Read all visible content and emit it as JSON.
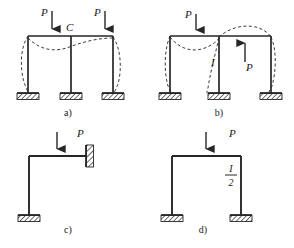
{
  "figure": {
    "background_color": "#ffffff",
    "line_color": "#262626",
    "dash_color": "#3a3a3a",
    "label_color": "#1a1a1a"
  },
  "panels": [
    {
      "id": "a",
      "caption": "a)",
      "description": "Two-bay portal frame with three fixed column bases, two downward loads P on the top beam, dashed buckled shape",
      "loads": [
        {
          "name": "load-p-left",
          "label": "P",
          "direction": "down"
        },
        {
          "name": "load-p-right",
          "label": "P",
          "direction": "down"
        }
      ],
      "node_labels": [
        {
          "name": "node-c",
          "label": "C"
        }
      ],
      "supports": 3,
      "support_type": "fixed"
    },
    {
      "id": "b",
      "caption": "b)",
      "description": "Two-bay portal frame with three fixed column bases, one downward load P on left bay and one upward load P in right bay, dashed buckled shape",
      "loads": [
        {
          "name": "load-p-top",
          "label": "P",
          "direction": "down"
        },
        {
          "name": "load-p-up",
          "label": "P",
          "direction": "up"
        }
      ],
      "node_labels": [
        {
          "name": "node-i",
          "label": "I"
        }
      ],
      "supports": 3,
      "support_type": "fixed"
    },
    {
      "id": "c",
      "caption": "c)",
      "description": "L-shaped frame, column fixed at base, beam fixed into a vertical wall at right end, downward load P on beam",
      "loads": [
        {
          "name": "load-p",
          "label": "P",
          "direction": "down"
        }
      ],
      "node_labels": [],
      "supports": 2,
      "support_type": "fixed-base-and-wall"
    },
    {
      "id": "d",
      "caption": "d)",
      "description": "Single-bay portal frame with two fixed column bases and a downward load P at midspan of the beam, right column labelled I over 2",
      "loads": [
        {
          "name": "load-p",
          "label": "P",
          "direction": "down"
        }
      ],
      "node_labels": [
        {
          "name": "stiffness-label",
          "numerator": "I",
          "denominator": "2"
        }
      ],
      "supports": 2,
      "support_type": "fixed"
    }
  ]
}
